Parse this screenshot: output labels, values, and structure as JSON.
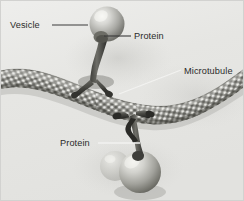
{
  "figure": {
    "type": "scientific-illustration",
    "style": "grayscale-airbrush",
    "width": 244,
    "height": 201,
    "background_color": "#e8e8e6",
    "border_color": "#d2d2d0"
  },
  "labels": [
    {
      "id": "vesicle-top",
      "text": "Vesicle",
      "x": 10,
      "y": 28,
      "anchor": "start",
      "leader": "M 52 25 L 88 25",
      "leader_style": "dark",
      "target": "upper-vesicle-sphere"
    },
    {
      "id": "protein-top",
      "text": "Protein",
      "x": 134,
      "y": 39,
      "anchor": "start",
      "leader": "M 104 36 L 131 36",
      "leader_style": "dark",
      "target": "upper-motor-protein"
    },
    {
      "id": "microtubule",
      "text": "Microtubule",
      "x": 184,
      "y": 74,
      "anchor": "start",
      "leader": "M 119 94 L 181 70",
      "leader_style": "light",
      "target": "microtubule-filament"
    },
    {
      "id": "protein-bottom",
      "text": "Protein",
      "x": 60,
      "y": 146,
      "anchor": "start",
      "leader": "M 98 143 L 140 143",
      "leader_style": "light",
      "target": "lower-motor-protein"
    }
  ],
  "structures": {
    "microtubule": {
      "name": "Microtubule",
      "description": "Long banded tubulin filament crossing the image diagonally",
      "subunit_pattern": "alpha-beta tubulin dimer checkerboard",
      "shade_light": "#d8d8d4",
      "shade_mid": "#8e8e8a",
      "shade_dark": "#4a4a48"
    },
    "upper_vesicle": {
      "name": "Vesicle",
      "description": "Spherical membrane-bound cargo at upper right",
      "cx": 107,
      "cy": 24,
      "r": 17,
      "shade_light": "#e4e4e0",
      "shade_dark": "#6e6e6a"
    },
    "upper_protein": {
      "name": "Protein",
      "description": "Motor protein linking upper vesicle to microtubule",
      "shade": "#55554f"
    },
    "lower_vesicle": {
      "name": "Vesicle",
      "description": "Spherical membrane-bound cargo at lower centre",
      "cx": 140,
      "cy": 173,
      "r": 21,
      "shade_light": "#dedeba",
      "shade_dark": "#6a6a66"
    },
    "lower_vesicle_small": {
      "name": "Vesicle",
      "description": "Smaller partially hidden vesicle behind the lower cargo",
      "cx": 115,
      "cy": 165,
      "r": 14
    },
    "lower_protein": {
      "name": "Protein",
      "description": "Motor protein walking along microtubule carrying lower vesicle",
      "shade": "#303030"
    }
  }
}
